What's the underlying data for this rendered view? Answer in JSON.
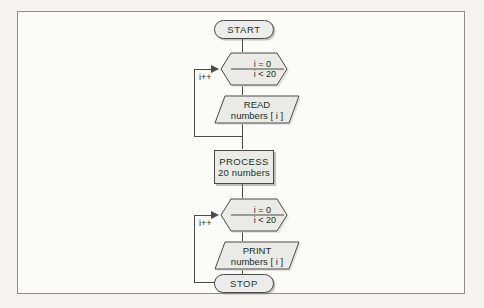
{
  "diagram": {
    "colors": {
      "stroke": "#4a4a46",
      "text": "#15311f",
      "node_fill": "#eaeae6",
      "shadow": "#82827d",
      "page": "#fbfbf8"
    },
    "nodes": [
      {
        "id": "start",
        "type": "terminator",
        "label": "START"
      },
      {
        "id": "loop1",
        "type": "loop",
        "line1": "i = 0",
        "line2": "i < 20",
        "increment": "i++"
      },
      {
        "id": "read",
        "type": "io",
        "line1": "READ",
        "line2": "numbers [ i ]"
      },
      {
        "id": "process",
        "type": "process",
        "line1": "PROCESS",
        "line2": "20 numbers"
      },
      {
        "id": "loop2",
        "type": "loop",
        "line1": "i = 0",
        "line2": "i < 20",
        "increment": "i++"
      },
      {
        "id": "print",
        "type": "io",
        "line1": "PRINT",
        "line2": "numbers [ i ]"
      },
      {
        "id": "stop",
        "type": "terminator",
        "label": "STOP"
      }
    ]
  }
}
